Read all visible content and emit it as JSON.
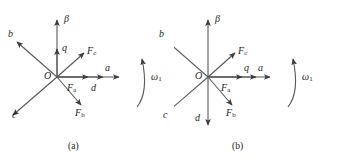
{
  "figure": {
    "type": "vector-diagram-pair",
    "stroke_color": "#58595b",
    "text_color": "#231f20",
    "background": "#ffffff"
  },
  "panels": [
    {
      "id": "a",
      "caption": "(a)",
      "origin_label": "O",
      "origin": {
        "x": 57,
        "y": 77
      },
      "rotation_label": "ω",
      "rotation_sub": "1",
      "vectors": [
        {
          "name": "beta-axis",
          "label": "β",
          "sub": "",
          "angle_deg": 90,
          "length": 57,
          "label_dx": 6,
          "label_dy": -4
        },
        {
          "name": "q-axis",
          "label": "q",
          "sub": "",
          "angle_deg": 90,
          "length": 28,
          "label_dx": 5,
          "label_dy": -3
        },
        {
          "name": "fc-vector",
          "label": "F",
          "sub": "c",
          "angle_deg": 41,
          "length": 36,
          "label_dx": 5,
          "label_dy": -6
        },
        {
          "name": "a-axis",
          "label": "a",
          "sub": "",
          "angle_deg": 0,
          "length": 62,
          "label_dx": -5,
          "label_dy": -12
        },
        {
          "name": "d-axis",
          "label": "d",
          "sub": "",
          "angle_deg": 0,
          "length": 46,
          "label_dx": -4,
          "label_dy": 4
        },
        {
          "name": "fa-vector",
          "label": "F",
          "sub": "a",
          "angle_deg": 0,
          "length": 31,
          "label_dx": -9,
          "label_dy": 5
        },
        {
          "name": "fb-vector",
          "label": "F",
          "sub": "b",
          "angle_deg": -49,
          "length": 37,
          "label_dx": -2,
          "label_dy": 4
        },
        {
          "name": "c-axis",
          "label": "c",
          "sub": "",
          "angle_deg": -139,
          "length": 58,
          "label_dx": 2,
          "label_dy": -10
        },
        {
          "name": "b-axis",
          "label": "b",
          "sub": "",
          "angle_deg": 139,
          "length": 53,
          "label_dx": -1,
          "label_dy": 0
        }
      ]
    },
    {
      "id": "b",
      "caption": "(b)",
      "origin_label": "O",
      "origin": {
        "x": 34,
        "y": 77
      },
      "rotation_label": "ω",
      "rotation_sub": "1",
      "vectors": [
        {
          "name": "beta-axis",
          "label": "β",
          "sub": "",
          "angle_deg": 90,
          "length": 57,
          "label_dx": 6,
          "label_dy": -4
        },
        {
          "name": "fc-vector",
          "label": "F",
          "sub": "c",
          "angle_deg": 41,
          "length": 36,
          "label_dx": 5,
          "label_dy": -6
        },
        {
          "name": "a-axis",
          "label": "a",
          "sub": "",
          "angle_deg": 0,
          "length": 62,
          "label_dx": -5,
          "label_dy": -12
        },
        {
          "name": "q-axis",
          "label": "q",
          "sub": "",
          "angle_deg": 0,
          "length": 48,
          "label_dx": -6,
          "label_dy": -12
        },
        {
          "name": "fa-vector",
          "label": "F",
          "sub": "a",
          "angle_deg": 0,
          "length": 34,
          "label_dx": -9,
          "label_dy": 5
        },
        {
          "name": "fb-vector",
          "label": "F",
          "sub": "b",
          "angle_deg": -49,
          "length": 37,
          "label_dx": -2,
          "label_dy": 4
        },
        {
          "name": "d-axis",
          "label": "d",
          "sub": "",
          "angle_deg": -90,
          "length": 48,
          "label_dx": -13,
          "label_dy": -3
        },
        {
          "name": "c-axis",
          "label": "c",
          "sub": "",
          "angle_deg": -139,
          "length": 58,
          "label_dx": 2,
          "label_dy": -10
        },
        {
          "name": "b-axis",
          "label": "b",
          "sub": "",
          "angle_deg": 139,
          "length": 53,
          "label_dx": -1,
          "label_dy": 0
        }
      ]
    }
  ]
}
